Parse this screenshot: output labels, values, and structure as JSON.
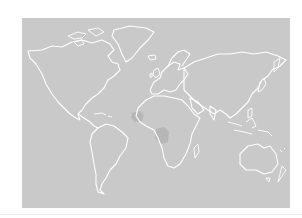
{
  "map": {
    "type": "world-outline",
    "projection": "equirectangular-like",
    "colors": {
      "background": "#ffffff",
      "ocean_land_fill": "#c9c9c9",
      "coastline": "#ffffff",
      "highlight": "#b6b6b6"
    },
    "highlighted_regions": [
      {
        "name": "west-africa",
        "color": "#b6b6b6"
      },
      {
        "name": "central-africa",
        "color": "#b6b6b6"
      }
    ],
    "labels": []
  }
}
